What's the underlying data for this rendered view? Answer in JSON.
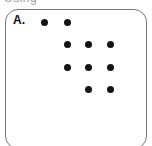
{
  "header": {
    "fragment_text": "Using"
  },
  "panel": {
    "label": "A.",
    "border_color": "#777777",
    "dot_color": "#141414",
    "dots": [
      {
        "row": 1,
        "col": 1,
        "x": 44,
        "y": 22
      },
      {
        "row": 1,
        "col": 2,
        "x": 67,
        "y": 22
      },
      {
        "row": 2,
        "col": 2,
        "x": 67,
        "y": 44
      },
      {
        "row": 2,
        "col": 3,
        "x": 88,
        "y": 44
      },
      {
        "row": 2,
        "col": 4,
        "x": 110,
        "y": 44
      },
      {
        "row": 3,
        "col": 2,
        "x": 67,
        "y": 67
      },
      {
        "row": 3,
        "col": 3,
        "x": 88,
        "y": 67
      },
      {
        "row": 3,
        "col": 4,
        "x": 110,
        "y": 67
      },
      {
        "row": 4,
        "col": 3,
        "x": 88,
        "y": 89
      },
      {
        "row": 4,
        "col": 4,
        "x": 110,
        "y": 89
      }
    ],
    "dot_count": 10
  }
}
